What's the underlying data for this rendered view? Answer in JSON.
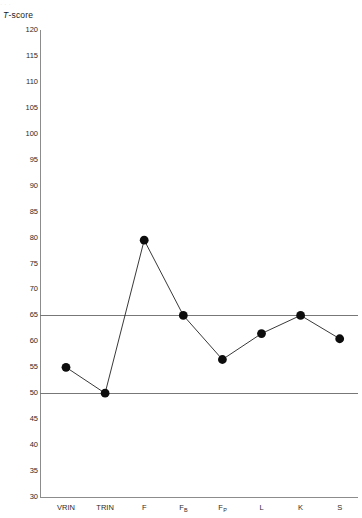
{
  "top_artifact": "· ·                                          ·",
  "chart_data": {
    "type": "line",
    "title": "",
    "subtitle": "",
    "xlabel": "",
    "ylabel": "T-score",
    "ylabel_italic_prefix": "T",
    "ylabel_rest": "-score",
    "categories": [
      "VRIN",
      "TRIN",
      "F",
      "FB",
      "FP",
      "L",
      "K",
      "S"
    ],
    "category_labels": [
      {
        "base": "VRIN",
        "sub": ""
      },
      {
        "base": "TRIN",
        "sub": ""
      },
      {
        "base": "F",
        "sub": ""
      },
      {
        "base": "F",
        "sub": "B"
      },
      {
        "base": "F",
        "sub": "P"
      },
      {
        "base": "L",
        "sub": ""
      },
      {
        "base": "K",
        "sub": ""
      },
      {
        "base": "S",
        "sub": ""
      }
    ],
    "values": [
      55,
      50,
      79.5,
      65,
      56.5,
      61.5,
      65,
      60.5
    ],
    "series": [
      {
        "name": "T-score profile",
        "values": [
          55,
          50,
          79.5,
          65,
          56.5,
          61.5,
          65,
          60.5
        ]
      }
    ],
    "ylim": [
      30,
      120
    ],
    "ytick_step": 5,
    "yticks": [
      120,
      115,
      110,
      105,
      100,
      95,
      90,
      85,
      80,
      75,
      70,
      65,
      60,
      55,
      50,
      45,
      40,
      35,
      30
    ],
    "grid": false,
    "legend": "none",
    "reference_lines": [
      {
        "value": 65,
        "label": "",
        "color": "#777777"
      },
      {
        "value": 50,
        "label": "",
        "color": "#777777"
      }
    ],
    "marker": "filled-circle",
    "marker_color": "#0d0d0d",
    "line_color": "#222222",
    "axis_color": "#8c8c8c"
  }
}
